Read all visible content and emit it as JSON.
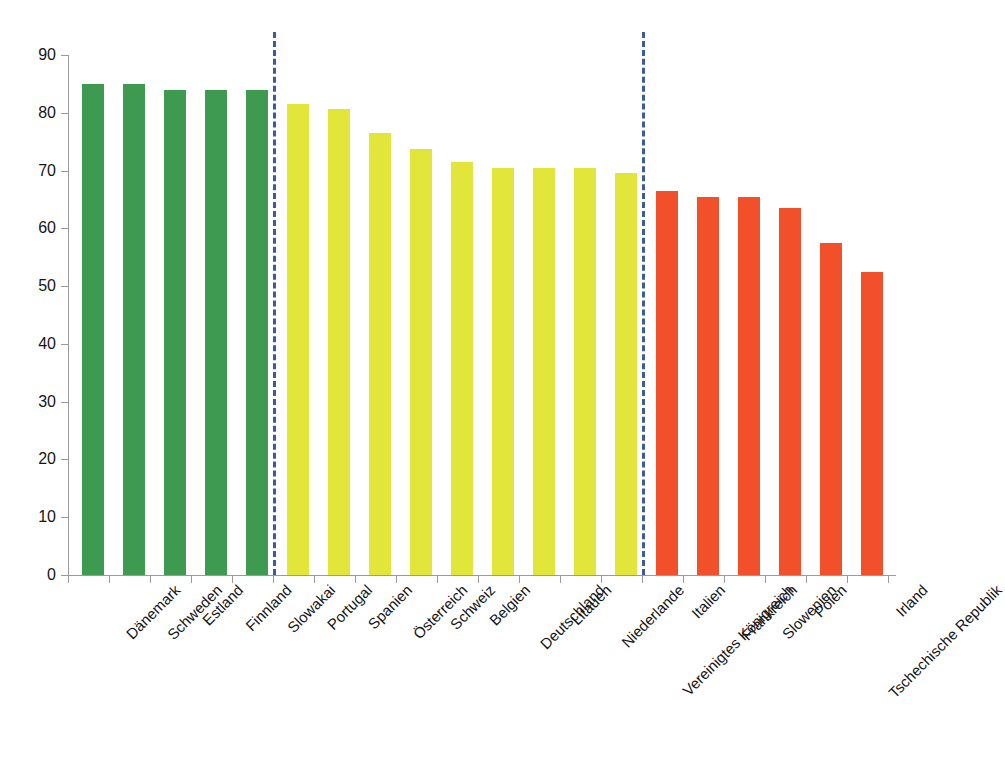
{
  "chart_data": {
    "type": "bar",
    "title": "",
    "subtitle": "",
    "xlabel": "",
    "ylabel": "",
    "ylim": [
      0,
      90
    ],
    "yticks": [
      0,
      10,
      20,
      30,
      40,
      50,
      60,
      70,
      80,
      90
    ],
    "ytick_labels": [
      "0",
      "10",
      "20",
      "30",
      "40",
      "50",
      "60",
      "70",
      "80",
      "90"
    ],
    "grid": false,
    "legend": null,
    "categories": [
      "Dänemark",
      "Schweden",
      "Estland",
      "Finnland",
      "Slowakai",
      "Portugal",
      "Spanien",
      "Österreich",
      "Schweiz",
      "Belgien",
      "Deutschland",
      "Litauen",
      "Niederlande",
      "Vereinigtes Königreich",
      "Italien",
      "Frankreich",
      "Slowenien",
      "Polen",
      "Tschechische Republik",
      "Irland"
    ],
    "values": [
      85.0,
      85.0,
      84.0,
      84.0,
      84.0,
      81.5,
      80.7,
      76.5,
      73.7,
      71.5,
      70.5,
      70.5,
      70.5,
      69.5,
      66.5,
      65.5,
      65.5,
      63.5,
      57.5,
      52.5
    ],
    "bar_colors": [
      "#3f9a51",
      "#3f9a51",
      "#3f9a51",
      "#3f9a51",
      "#3f9a51",
      "#e2e63b",
      "#e2e63b",
      "#e2e63b",
      "#e2e63b",
      "#e2e63b",
      "#e2e63b",
      "#e2e63b",
      "#e2e63b",
      "#e2e63b",
      "#f2502a",
      "#f2502a",
      "#f2502a",
      "#f2502a",
      "#f2502a",
      "#f2502a"
    ],
    "groups": [
      {
        "name": "green-group",
        "color": "#3f9a51",
        "start_index": 0,
        "end_index": 4
      },
      {
        "name": "yellow-group",
        "color": "#e2e63b",
        "start_index": 5,
        "end_index": 13
      },
      {
        "name": "red-group",
        "color": "#f2502a",
        "start_index": 14,
        "end_index": 19
      }
    ],
    "dividers": [
      {
        "name": "divider-green-yellow",
        "after_index": 4,
        "color": "#3c5b9b",
        "style": "dashed"
      },
      {
        "name": "divider-yellow-red",
        "after_index": 13,
        "color": "#3c5b9b",
        "style": "dashed"
      }
    ],
    "axis_color": "#9a9a9a",
    "background": "#ffffff"
  }
}
